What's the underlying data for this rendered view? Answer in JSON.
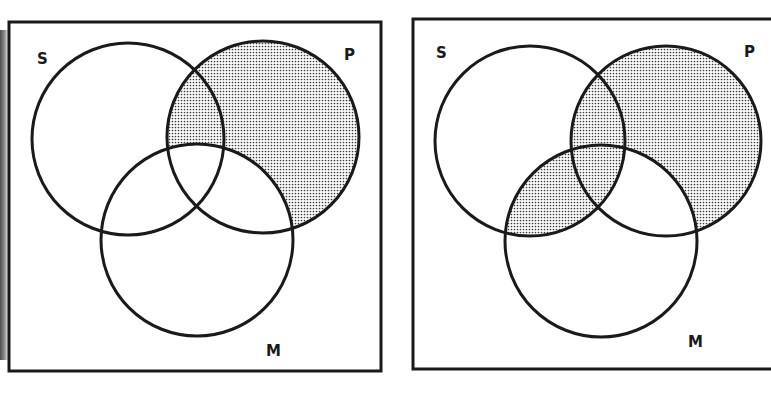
{
  "diagrams": [
    {
      "id": "left",
      "frame": {
        "x": 9,
        "y": 22,
        "w": 372,
        "h": 349
      },
      "labels": {
        "s": "S",
        "p": "P",
        "m": "M"
      },
      "label_pos": {
        "s": [
          37,
          64
        ],
        "p": [
          350,
          60
        ],
        "m": [
          274,
          356
        ]
      },
      "circles": {
        "S": {
          "cx": 128,
          "cy": 139,
          "r": 96
        },
        "P": {
          "cx": 263,
          "cy": 137,
          "r": 96
        },
        "M": {
          "cx": 197,
          "cy": 240,
          "r": 96
        }
      },
      "shaded_regions": [
        "P minus M"
      ]
    },
    {
      "id": "right",
      "frame": {
        "x": 413,
        "y": 19,
        "w": 372,
        "h": 350
      },
      "labels": {
        "s": "S",
        "p": "P",
        "m": "M"
      },
      "label_pos": {
        "s": [
          441,
          58
        ],
        "p": [
          749,
          57
        ],
        "m": [
          696,
          347
        ]
      },
      "circles": {
        "S": {
          "cx": 530,
          "cy": 141,
          "r": 95
        },
        "P": {
          "cx": 666,
          "cy": 141,
          "r": 95
        },
        "M": {
          "cx": 601,
          "cy": 241,
          "r": 96
        }
      },
      "shaded_regions": [
        "P minus M",
        "S intersect M"
      ]
    }
  ],
  "colors": {
    "stroke": "#1a1a1a",
    "shade_dot": "#3a3a3a",
    "background": "#ffffff"
  }
}
